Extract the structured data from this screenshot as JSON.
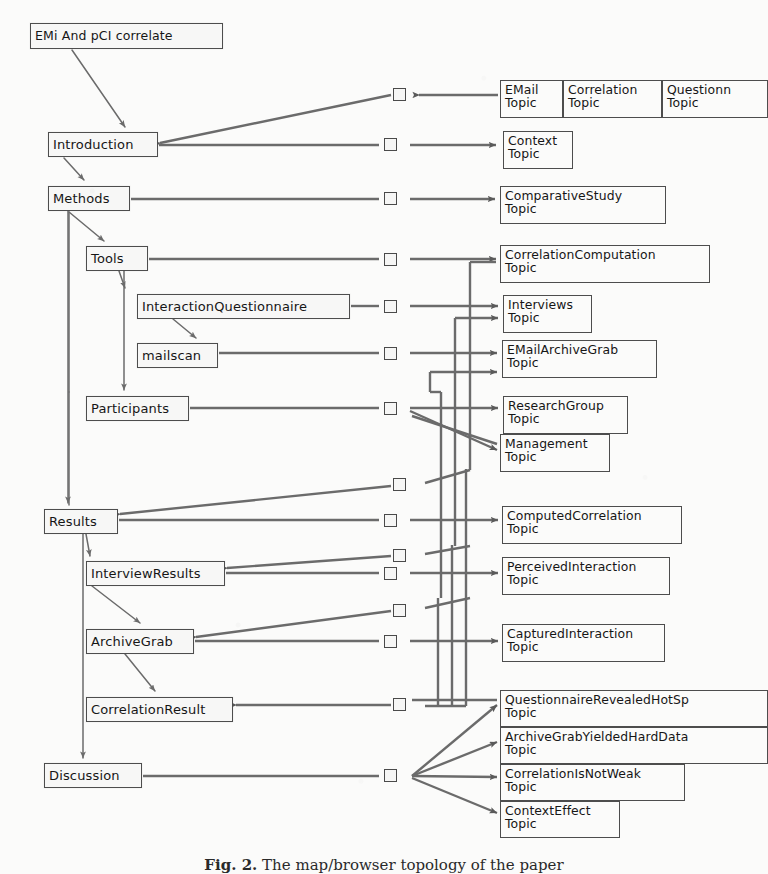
{
  "figure": {
    "background_color": "#fbfbfa",
    "ink_color": "#4d4d4d",
    "caption_label": "Fig. 2.",
    "caption_text": "The map/browser topology of the paper"
  },
  "root_node": {
    "label": "EMi And pCI correlate",
    "x": 30,
    "y": 23,
    "w": 193,
    "h": 26
  },
  "sections": [
    {
      "name": "introduction",
      "label": "Introduction",
      "x": 48,
      "y": 132,
      "w": 110,
      "h": 25
    },
    {
      "name": "methods",
      "label": "Methods",
      "x": 48,
      "y": 186,
      "w": 82,
      "h": 25
    },
    {
      "name": "tools",
      "label": "Tools",
      "x": 86,
      "y": 246,
      "w": 62,
      "h": 25
    },
    {
      "name": "interactionq",
      "label": "InteractionQuestionnaire",
      "x": 137,
      "y": 294,
      "w": 213,
      "h": 25
    },
    {
      "name": "mailscan",
      "label": "mailscan",
      "x": 137,
      "y": 343,
      "w": 81,
      "h": 25
    },
    {
      "name": "participants",
      "label": "Participants",
      "x": 86,
      "y": 396,
      "w": 103,
      "h": 25
    },
    {
      "name": "results",
      "label": "Results",
      "x": 44,
      "y": 509,
      "w": 74,
      "h": 25
    },
    {
      "name": "interviewresults",
      "label": "InterviewResults",
      "x": 86,
      "y": 561,
      "w": 139,
      "h": 25
    },
    {
      "name": "archivegrab",
      "label": "ArchiveGrab",
      "x": 86,
      "y": 629,
      "w": 108,
      "h": 25
    },
    {
      "name": "correlationresult",
      "label": "CorrelationResult",
      "x": 86,
      "y": 697,
      "w": 147,
      "h": 25
    },
    {
      "name": "discussion",
      "label": "Discussion",
      "x": 44,
      "y": 763,
      "w": 98,
      "h": 25
    }
  ],
  "topics": [
    {
      "name": "email",
      "line1": "EMail",
      "line2": "Topic",
      "x": 500,
      "y": 80,
      "w": 63,
      "h": 38
    },
    {
      "name": "correlation",
      "line1": "Correlation",
      "line2": "Topic",
      "x": 563,
      "y": 80,
      "w": 99,
      "h": 38
    },
    {
      "name": "questionnaire",
      "line1": "Questionn",
      "line2": "Topic",
      "x": 662,
      "y": 80,
      "w": 106,
      "h": 38,
      "clipped": true
    },
    {
      "name": "context",
      "line1": "Context",
      "line2": "Topic",
      "x": 503,
      "y": 131,
      "w": 70,
      "h": 38
    },
    {
      "name": "comparative",
      "line1": "ComparativeStudy",
      "line2": "Topic",
      "x": 500,
      "y": 186,
      "w": 166,
      "h": 38
    },
    {
      "name": "corrcomp",
      "line1": "CorrelationComputation",
      "line2": "Topic",
      "x": 500,
      "y": 245,
      "w": 210,
      "h": 38
    },
    {
      "name": "interviews",
      "line1": "Interviews",
      "line2": "Topic",
      "x": 503,
      "y": 295,
      "w": 89,
      "h": 38
    },
    {
      "name": "emailarchive",
      "line1": "EMailArchiveGrab",
      "line2": "Topic",
      "x": 502,
      "y": 340,
      "w": 155,
      "h": 38
    },
    {
      "name": "researchgroup",
      "line1": "ResearchGroup",
      "line2": "Topic",
      "x": 503,
      "y": 396,
      "w": 125,
      "h": 38
    },
    {
      "name": "management",
      "line1": "Management",
      "line2": "Topic",
      "x": 500,
      "y": 434,
      "w": 110,
      "h": 38
    },
    {
      "name": "computedcorr",
      "line1": "ComputedCorrelation",
      "line2": "Topic",
      "x": 502,
      "y": 506,
      "w": 180,
      "h": 38
    },
    {
      "name": "perceived",
      "line1": "PerceivedInteraction",
      "line2": "Topic",
      "x": 502,
      "y": 557,
      "w": 168,
      "h": 38
    },
    {
      "name": "captured",
      "line1": "CapturedInteraction",
      "line2": "Topic",
      "x": 502,
      "y": 624,
      "w": 163,
      "h": 38
    },
    {
      "name": "qrhotspot",
      "line1": "QuestionnaireRevealedHotSp",
      "line2": "Topic",
      "x": 500,
      "y": 690,
      "w": 268,
      "h": 37,
      "clipped": true
    },
    {
      "name": "agharddata",
      "line1": "ArchiveGrabYieldedHardData",
      "line2": "Topic",
      "x": 500,
      "y": 727,
      "w": 268,
      "h": 37,
      "clipped": true
    },
    {
      "name": "notweak",
      "line1": "CorrelationIsNotWeak",
      "line2": "Topic",
      "x": 500,
      "y": 764,
      "w": 185,
      "h": 37
    },
    {
      "name": "contexteffect",
      "line1": "ContextEffect",
      "line2": "Topic",
      "x": 500,
      "y": 801,
      "w": 120,
      "h": 37
    }
  ],
  "ports": [
    {
      "name": "port-introduction-in",
      "x": 393,
      "y": 88,
      "direction": "left"
    },
    {
      "name": "port-introduction-out",
      "x": 384,
      "y": 138,
      "direction": "right"
    },
    {
      "name": "port-methods-out",
      "x": 384,
      "y": 192,
      "direction": "right"
    },
    {
      "name": "port-tools-out",
      "x": 384,
      "y": 253,
      "direction": "right"
    },
    {
      "name": "port-interactionq-out",
      "x": 384,
      "y": 300,
      "direction": "right"
    },
    {
      "name": "port-mailscan-out",
      "x": 384,
      "y": 347,
      "direction": "right"
    },
    {
      "name": "port-participants-out",
      "x": 384,
      "y": 402,
      "direction": "right"
    },
    {
      "name": "port-results-in",
      "x": 393,
      "y": 484,
      "direction": "left"
    },
    {
      "name": "port-results-out",
      "x": 384,
      "y": 514,
      "direction": "right"
    },
    {
      "name": "port-iresults-in",
      "x": 393,
      "y": 553,
      "direction": "left"
    },
    {
      "name": "port-iresults-out",
      "x": 384,
      "y": 567,
      "direction": "right"
    },
    {
      "name": "port-archive-in",
      "x": 393,
      "y": 608,
      "direction": "left"
    },
    {
      "name": "port-archive-out",
      "x": 384,
      "y": 635,
      "direction": "right"
    },
    {
      "name": "port-corrresult-in",
      "x": 393,
      "y": 698,
      "direction": "left"
    },
    {
      "name": "port-discussion-out",
      "x": 384,
      "y": 769,
      "direction": "right"
    }
  ],
  "edges": [
    {
      "from": "root_node",
      "to": "introduction",
      "kind": "containment"
    },
    {
      "from": "introduction",
      "to": "methods",
      "kind": "containment"
    },
    {
      "from": "methods",
      "to": "tools",
      "kind": "containment"
    },
    {
      "from": "methods",
      "to": "participants",
      "kind": "containment"
    },
    {
      "from": "methods",
      "to": "results",
      "kind": "containment"
    },
    {
      "from": "methods",
      "to": "discussion",
      "kind": "containment"
    },
    {
      "from": "tools",
      "to": "interactionq",
      "kind": "containment"
    },
    {
      "from": "tools",
      "to": "participants",
      "kind": "containment"
    },
    {
      "from": "interactionq",
      "to": "mailscan",
      "kind": "containment"
    },
    {
      "from": "results",
      "to": "interviewresults",
      "kind": "containment"
    },
    {
      "from": "interviewresults",
      "to": "archivegrab",
      "kind": "containment"
    },
    {
      "from": "archivegrab",
      "to": "correlationresult",
      "kind": "containment"
    },
    {
      "from": "introduction",
      "to": "email",
      "kind": "association"
    },
    {
      "from": "introduction",
      "to": "context",
      "kind": "association"
    },
    {
      "from": "methods",
      "to": "comparative",
      "kind": "association"
    },
    {
      "from": "tools",
      "to": "corrcomp",
      "kind": "association"
    },
    {
      "from": "interactionq",
      "to": "interviews",
      "kind": "association"
    },
    {
      "from": "mailscan",
      "to": "emailarchive",
      "kind": "association"
    },
    {
      "from": "participants",
      "to": "researchgroup",
      "kind": "association"
    },
    {
      "from": "participants",
      "to": "management",
      "kind": "association"
    },
    {
      "from": "results",
      "to": "computedcorr",
      "kind": "association"
    },
    {
      "from": "interviewresults",
      "to": "perceived",
      "kind": "association"
    },
    {
      "from": "archivegrab",
      "to": "captured",
      "kind": "association"
    },
    {
      "from": "discussion",
      "to": "qrhotspot",
      "kind": "association"
    },
    {
      "from": "discussion",
      "to": "agharddata",
      "kind": "association"
    },
    {
      "from": "discussion",
      "to": "notweak",
      "kind": "association"
    },
    {
      "from": "discussion",
      "to": "contexteffect",
      "kind": "association"
    }
  ]
}
